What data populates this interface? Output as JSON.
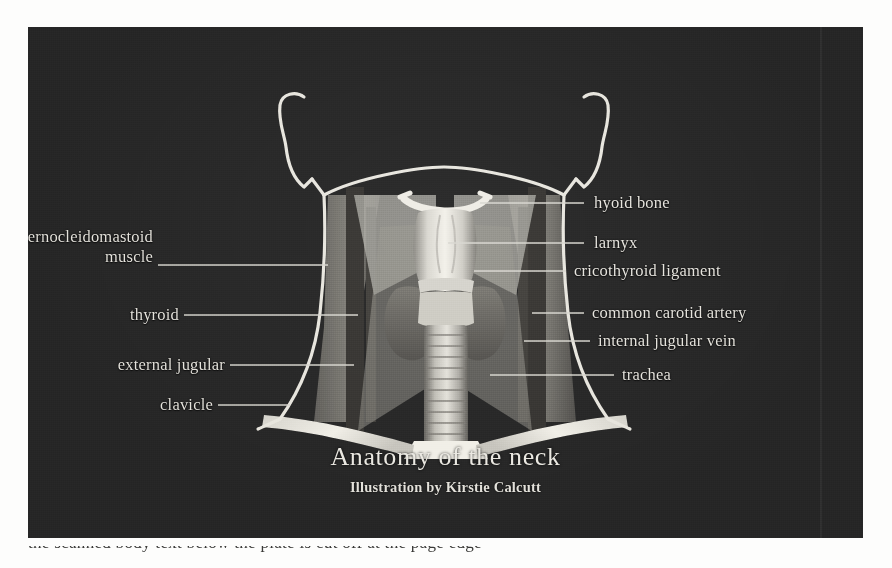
{
  "plate": {
    "background_color": "#2b2b2b",
    "ink_color": "#e8e6e0"
  },
  "title": {
    "heading": "Anatomy of the neck",
    "credit": "Illustration by Kirstie Calcutt"
  },
  "labels_left": [
    {
      "id": "sternocleidomastoid-muscle",
      "line1": "sternocleidomastoid",
      "line2": "muscle"
    },
    {
      "id": "thyroid",
      "line1": "thyroid",
      "line2": ""
    },
    {
      "id": "external-jugular",
      "line1": "external jugular",
      "line2": ""
    },
    {
      "id": "clavicle",
      "line1": "clavicle",
      "line2": ""
    }
  ],
  "labels_right": [
    {
      "id": "hyoid-bone",
      "text": "hyoid bone"
    },
    {
      "id": "larynx",
      "text": "larnyx"
    },
    {
      "id": "cricothyroid-ligament",
      "text": "cricothyroid ligament"
    },
    {
      "id": "common-carotid-artery",
      "text": "common carotid artery"
    },
    {
      "id": "internal-jugular-vein",
      "text": "internal jugular vein"
    },
    {
      "id": "trachea",
      "text": "trachea"
    }
  ],
  "undertext": {
    "clipped_line": "the scanned body text below the plate is cut off at the page edge"
  },
  "structures": [
    {
      "id": "head-jaw-outline",
      "name": "head and jaw outline"
    },
    {
      "id": "neck-outline",
      "name": "neck outline"
    },
    {
      "id": "sternocleidomastoid",
      "name": "sternocleidomastoid muscle"
    },
    {
      "id": "hyoid-bone",
      "name": "hyoid bone"
    },
    {
      "id": "larynx",
      "name": "larynx"
    },
    {
      "id": "cricothyroid-ligament",
      "name": "cricothyroid ligament"
    },
    {
      "id": "thyroid-gland",
      "name": "thyroid gland"
    },
    {
      "id": "trachea",
      "name": "trachea"
    },
    {
      "id": "common-carotid-artery",
      "name": "common carotid artery"
    },
    {
      "id": "internal-jugular-vein",
      "name": "internal jugular vein"
    },
    {
      "id": "external-jugular-vein",
      "name": "external jugular vein"
    },
    {
      "id": "clavicle-left",
      "name": "left clavicle"
    },
    {
      "id": "clavicle-right",
      "name": "right clavicle"
    },
    {
      "id": "manubrium",
      "name": "manubrium of sternum"
    }
  ]
}
